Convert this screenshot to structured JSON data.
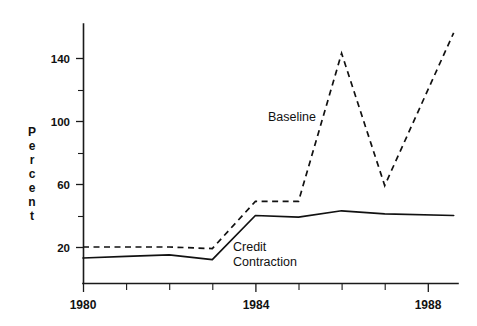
{
  "chart_data": {
    "type": "line",
    "title": "",
    "subtitle": "",
    "xlabel": "",
    "ylabel": "Percent",
    "xlim": [
      1980,
      1988.6
    ],
    "ylim": [
      0,
      160
    ],
    "grid": false,
    "legend_position": "inline-annotation",
    "y_ticks_major": [
      20,
      60,
      100,
      140
    ],
    "y_ticks_minor": [
      40,
      80,
      120
    ],
    "y_tick_labels": [
      "20",
      "60",
      "100",
      "140"
    ],
    "x_ticks_major": [
      1980,
      1984,
      1988
    ],
    "x_ticks_minor": [
      1981,
      1982,
      1983,
      1985,
      1986,
      1987
    ],
    "x_tick_labels": [
      "1980",
      "1984",
      "1988"
    ],
    "x": [
      1980,
      1981,
      1982,
      1983,
      1984,
      1985,
      1986,
      1987,
      1988.6
    ],
    "series": [
      {
        "name": "Baseline",
        "style": "dashed",
        "color": "#111111",
        "values": [
          20,
          20,
          20,
          19,
          49,
          49,
          143,
          59,
          156
        ],
        "annotation": {
          "text": "Baseline",
          "x": 1984.9,
          "y": 105
        }
      },
      {
        "name": "Credit Contraction",
        "style": "solid",
        "color": "#111111",
        "values": [
          13,
          14,
          15,
          12,
          40,
          39,
          43,
          41,
          40
        ],
        "annotation": {
          "text_line1": "Credit",
          "text_line2": "Contraction",
          "x": 1983.6,
          "y": 22
        }
      }
    ],
    "annotations": [
      {
        "id": "baseline-label",
        "text": "Baseline"
      },
      {
        "id": "credit-contraction-label-line1",
        "text": "Credit"
      },
      {
        "id": "credit-contraction-label-line2",
        "text": "Contraction"
      }
    ],
    "axis_label_letters": [
      "P",
      "e",
      "r",
      "c",
      "e",
      "n",
      "t"
    ],
    "colors": {
      "ink": "#111111",
      "background": "#ffffff"
    }
  }
}
